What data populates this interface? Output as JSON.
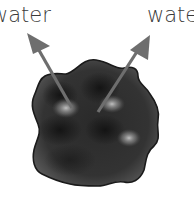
{
  "diagram": {
    "labels": {
      "left": "water",
      "right": "water"
    },
    "arrows": [
      {
        "name": "left-arrow",
        "direction": "up-left",
        "color": "#6e6e6e"
      },
      {
        "name": "right-arrow",
        "direction": "up-right",
        "color": "#6e6e6e"
      }
    ],
    "particle": {
      "shape": "wavy-blob",
      "fill": "#2e2e2e",
      "outline": "#1a1a1a",
      "highlight": "#bdbdbd"
    }
  }
}
